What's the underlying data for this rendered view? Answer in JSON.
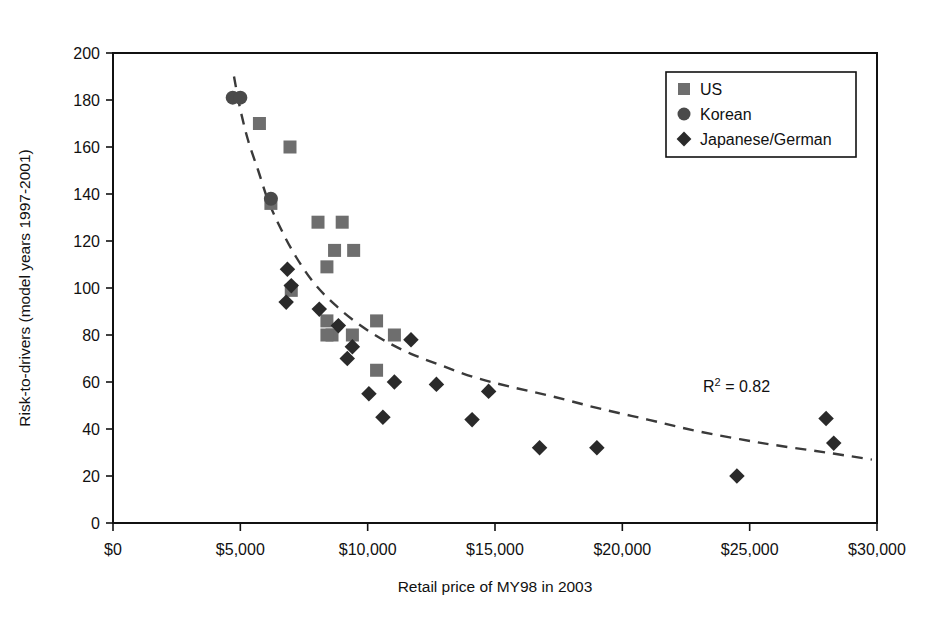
{
  "chart_data": {
    "type": "scatter",
    "title": "",
    "xlabel": "Retail price of MY98 in 2003",
    "ylabel": "Risk-to-drivers (model years 1997-2001)",
    "xlim": [
      0,
      30000
    ],
    "ylim": [
      0,
      200
    ],
    "xticks": [
      0,
      5000,
      10000,
      15000,
      20000,
      25000,
      30000
    ],
    "xtick_labels": [
      "$0",
      "$5,000",
      "$10,000",
      "$15,000",
      "$20,000",
      "$25,000",
      "$30,000"
    ],
    "yticks": [
      0,
      20,
      40,
      60,
      80,
      100,
      120,
      140,
      160,
      180,
      200
    ],
    "ytick_labels": [
      "0",
      "20",
      "40",
      "60",
      "80",
      "100",
      "120",
      "140",
      "160",
      "180",
      "200"
    ],
    "grid": false,
    "legend_position": "top-right",
    "annotations": [
      {
        "text": "R² = 0.82",
        "x": 21500,
        "y": 71
      }
    ],
    "trendline": {
      "style": "dashed",
      "color": "#3a3a3a",
      "description": "power-law decay fit through the scatter",
      "points": [
        [
          4750,
          190
        ],
        [
          5000,
          176
        ],
        [
          5300,
          163
        ],
        [
          5700,
          150
        ],
        [
          6100,
          137
        ],
        [
          6600,
          125
        ],
        [
          7200,
          113
        ],
        [
          7900,
          102
        ],
        [
          8700,
          93
        ],
        [
          9600,
          85
        ],
        [
          10600,
          78
        ],
        [
          11700,
          72
        ],
        [
          12900,
          67
        ],
        [
          14200,
          62
        ],
        [
          15600,
          58
        ],
        [
          17200,
          54
        ],
        [
          19000,
          49
        ],
        [
          21000,
          44
        ],
        [
          23000,
          39
        ],
        [
          25500,
          34
        ],
        [
          28000,
          30
        ],
        [
          29800,
          27
        ]
      ]
    },
    "series": [
      {
        "name": "US",
        "marker": "square",
        "color": "#6e6e6e",
        "points": [
          [
            5750,
            170
          ],
          [
            6950,
            160
          ],
          [
            6200,
            136
          ],
          [
            8050,
            128
          ],
          [
            9000,
            128
          ],
          [
            8700,
            116
          ],
          [
            9450,
            116
          ],
          [
            8400,
            109
          ],
          [
            7000,
            99
          ],
          [
            8600,
            80
          ],
          [
            8400,
            86
          ],
          [
            8400,
            80
          ],
          [
            10350,
            86
          ],
          [
            9400,
            80
          ],
          [
            11050,
            80
          ],
          [
            10350,
            65
          ]
        ]
      },
      {
        "name": "Korean",
        "marker": "circle",
        "color": "#4a4a4a",
        "points": [
          [
            4700,
            181
          ],
          [
            5000,
            181
          ],
          [
            6200,
            138
          ]
        ]
      },
      {
        "name": "Japanese/German",
        "marker": "diamond",
        "color": "#2a2a2a",
        "points": [
          [
            6850,
            108
          ],
          [
            7000,
            101
          ],
          [
            6800,
            94
          ],
          [
            8100,
            91
          ],
          [
            8850,
            84
          ],
          [
            9400,
            75
          ],
          [
            9200,
            70
          ],
          [
            10050,
            55
          ],
          [
            10600,
            45
          ],
          [
            11050,
            60
          ],
          [
            11700,
            78
          ],
          [
            12700,
            59
          ],
          [
            14100,
            44
          ],
          [
            14750,
            56
          ],
          [
            16750,
            32
          ],
          [
            19000,
            32
          ],
          [
            24500,
            20
          ],
          [
            28000,
            44.5
          ],
          [
            28300,
            34
          ]
        ]
      }
    ]
  },
  "legend": {
    "entries": [
      {
        "label": "US",
        "marker": "square",
        "color": "#6e6e6e"
      },
      {
        "label": "Korean",
        "marker": "circle",
        "color": "#4a4a4a"
      },
      {
        "label": "Japanese/German",
        "marker": "diamond",
        "color": "#2a2a2a"
      }
    ]
  }
}
